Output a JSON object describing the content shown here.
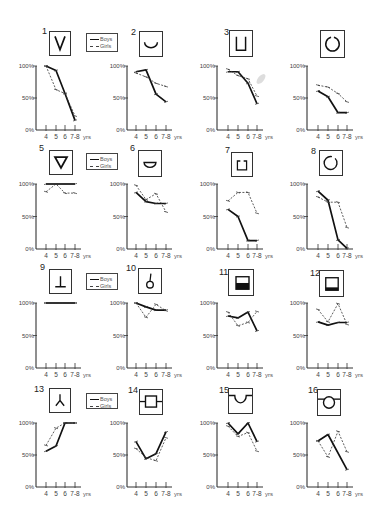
{
  "figure": {
    "legend": {
      "boys_label": "Boys",
      "girls_label": "Girls"
    },
    "y_ticks": [
      "100%",
      "50%",
      "0%"
    ],
    "x_unit": "yrs",
    "colors": {
      "boys": "#111111",
      "girls": "#333333",
      "axis": "#333333"
    }
  },
  "chart_data": [
    {
      "number": "1",
      "shape": "v-shape",
      "type": "line",
      "categories": [
        "4",
        "5",
        "6",
        "7-8"
      ],
      "xlabel": "yrs",
      "ylabel": "",
      "ylim": [
        0,
        100
      ],
      "yticks": [
        "0%",
        "50%",
        "100%"
      ],
      "grid": false,
      "series": [
        {
          "name": "Boys",
          "values": [
            100,
            93,
            57,
            15
          ]
        },
        {
          "name": "Girls",
          "values": [
            100,
            63,
            57,
            22
          ]
        }
      ]
    },
    {
      "number": "2",
      "shape": "arc-shape",
      "type": "line",
      "categories": [
        "4",
        "5",
        "6",
        "7-8"
      ],
      "xlabel": "yrs",
      "ylabel": "",
      "ylim": [
        0,
        100
      ],
      "yticks": [
        "0%",
        "50%",
        "100%"
      ],
      "grid": false,
      "series": [
        {
          "name": "Boys",
          "values": [
            91,
            94,
            56,
            44
          ]
        },
        {
          "name": "Girls",
          "values": [
            89,
            83,
            73,
            68
          ]
        }
      ]
    },
    {
      "number": "3",
      "shape": "u-square-shape",
      "type": "line",
      "categories": [
        "4",
        "5",
        "6",
        "7-8"
      ],
      "xlabel": "yrs",
      "ylabel": "",
      "ylim": [
        0,
        100
      ],
      "yticks": [
        "0%",
        "50%",
        "100%"
      ],
      "grid": false,
      "series": [
        {
          "name": "Boys",
          "values": [
            91,
            91,
            73,
            41
          ]
        },
        {
          "name": "Girls",
          "values": [
            95,
            85,
            80,
            53
          ]
        }
      ]
    },
    {
      "number": "",
      "shape": "open-circle-top-shape",
      "type": "line",
      "categories": [
        "4",
        "5",
        "6",
        "7-8"
      ],
      "xlabel": "yrs",
      "ylabel": "",
      "ylim": [
        0,
        100
      ],
      "yticks": [
        "0%",
        "50%",
        "100%"
      ],
      "grid": false,
      "series": [
        {
          "name": "Boys",
          "values": [
            61,
            52,
            27,
            27
          ]
        },
        {
          "name": "Girls",
          "values": [
            70,
            67,
            57,
            44
          ]
        }
      ]
    },
    {
      "number": "5",
      "shape": "inverted-triangle-shape",
      "type": "line",
      "categories": [
        "4",
        "5",
        "6",
        "7-8"
      ],
      "xlabel": "yrs",
      "ylabel": "",
      "ylim": [
        0,
        100
      ],
      "yticks": [
        "0%",
        "50%",
        "100%"
      ],
      "grid": false,
      "series": [
        {
          "name": "Boys",
          "values": [
            100,
            100,
            100,
            100
          ]
        },
        {
          "name": "Girls",
          "values": [
            88,
            100,
            86,
            86
          ]
        }
      ]
    },
    {
      "number": "6",
      "shape": "half-disk-shape",
      "type": "line",
      "categories": [
        "4",
        "5",
        "6",
        "7-8"
      ],
      "xlabel": "yrs",
      "ylabel": "",
      "ylim": [
        0,
        100
      ],
      "yticks": [
        "0%",
        "50%",
        "100%"
      ],
      "grid": false,
      "series": [
        {
          "name": "Boys",
          "values": [
            87,
            73,
            70,
            70
          ]
        },
        {
          "name": "Girls",
          "values": [
            98,
            76,
            85,
            57
          ]
        }
      ]
    },
    {
      "number": "7",
      "shape": "open-square-top-shape",
      "type": "line",
      "categories": [
        "4",
        "5",
        "6",
        "7-8"
      ],
      "xlabel": "yrs",
      "ylabel": "",
      "ylim": [
        0,
        100
      ],
      "yticks": [
        "0%",
        "50%",
        "100%"
      ],
      "grid": false,
      "series": [
        {
          "name": "Boys",
          "values": [
            61,
            50,
            13,
            13
          ]
        },
        {
          "name": "Girls",
          "values": [
            74,
            87,
            87,
            55
          ]
        }
      ]
    },
    {
      "number": "8",
      "shape": "open-circle-side-shape",
      "type": "line",
      "categories": [
        "4",
        "5",
        "6",
        "7-8"
      ],
      "xlabel": "yrs",
      "ylabel": "",
      "ylim": [
        0,
        100
      ],
      "yticks": [
        "0%",
        "50%",
        "100%"
      ],
      "grid": false,
      "series": [
        {
          "name": "Boys",
          "values": [
            89,
            75,
            14,
            1
          ]
        },
        {
          "name": "Girls",
          "values": [
            80,
            72,
            72,
            33
          ]
        }
      ]
    },
    {
      "number": "9",
      "shape": "inverted-t-shape",
      "type": "line",
      "categories": [
        "4",
        "5",
        "6",
        "7-8"
      ],
      "xlabel": "yrs",
      "ylabel": "",
      "ylim": [
        0,
        100
      ],
      "yticks": [
        "0%",
        "50%",
        "100%"
      ],
      "grid": false,
      "series": [
        {
          "name": "Boys",
          "values": [
            100,
            100,
            100,
            100
          ]
        },
        {
          "name": "Girls",
          "values": [
            100,
            100,
            100,
            100
          ]
        }
      ]
    },
    {
      "number": "10",
      "shape": "lollipop-shape",
      "type": "line",
      "categories": [
        "4",
        "5",
        "6",
        "7-8"
      ],
      "xlabel": "yrs",
      "ylabel": "",
      "ylim": [
        0,
        100
      ],
      "yticks": [
        "0%",
        "50%",
        "100%"
      ],
      "grid": false,
      "series": [
        {
          "name": "Boys",
          "values": [
            100,
            94,
            89,
            89
          ]
        },
        {
          "name": "Girls",
          "values": [
            100,
            78,
            98,
            88
          ]
        }
      ]
    },
    {
      "number": "11",
      "shape": "half-filled-square-shape",
      "type": "line",
      "categories": [
        "4",
        "5",
        "6",
        "7-8"
      ],
      "xlabel": "yrs",
      "ylabel": "",
      "ylim": [
        0,
        100
      ],
      "yticks": [
        "0%",
        "50%",
        "100%"
      ],
      "grid": false,
      "series": [
        {
          "name": "Boys",
          "values": [
            80,
            77,
            86,
            57
          ]
        },
        {
          "name": "Girls",
          "values": [
            86,
            65,
            70,
            87
          ]
        }
      ]
    },
    {
      "number": "12",
      "shape": "strip-filled-square-shape",
      "type": "line",
      "categories": [
        "4",
        "5",
        "6",
        "7-8"
      ],
      "xlabel": "yrs",
      "ylabel": "",
      "ylim": [
        0,
        100
      ],
      "yticks": [
        "0%",
        "50%",
        "100%"
      ],
      "grid": false,
      "series": [
        {
          "name": "Boys",
          "values": [
            71,
            66,
            70,
            70
          ]
        },
        {
          "name": "Girls",
          "values": [
            90,
            71,
            99,
            67
          ]
        }
      ]
    },
    {
      "number": "13",
      "shape": "inverted-y-shape",
      "type": "line",
      "categories": [
        "4",
        "5",
        "6",
        "7-8"
      ],
      "xlabel": "yrs",
      "ylabel": "",
      "ylim": [
        0,
        100
      ],
      "yticks": [
        "0%",
        "50%",
        "100%"
      ],
      "grid": false,
      "series": [
        {
          "name": "Boys",
          "values": [
            56,
            64,
            100,
            100
          ]
        },
        {
          "name": "Girls",
          "values": [
            65,
            92,
            100,
            100
          ]
        }
      ]
    },
    {
      "number": "14",
      "shape": "square-on-line-shape",
      "type": "line",
      "categories": [
        "4",
        "5",
        "6",
        "7-8"
      ],
      "xlabel": "yrs",
      "ylabel": "",
      "ylim": [
        0,
        100
      ],
      "yticks": [
        "0%",
        "50%",
        "100%"
      ],
      "grid": false,
      "series": [
        {
          "name": "Boys",
          "values": [
            71,
            44,
            52,
            86
          ]
        },
        {
          "name": "Girls",
          "values": [
            60,
            46,
            41,
            77
          ]
        }
      ]
    },
    {
      "number": "15",
      "shape": "notch-on-line-shape",
      "type": "line",
      "categories": [
        "4",
        "5",
        "6",
        "7-8"
      ],
      "xlabel": "yrs",
      "ylabel": "",
      "ylim": [
        0,
        100
      ],
      "yticks": [
        "0%",
        "50%",
        "100%"
      ],
      "grid": false,
      "series": [
        {
          "name": "Boys",
          "values": [
            100,
            83,
            100,
            71
          ]
        },
        {
          "name": "Girls",
          "values": [
            95,
            79,
            85,
            56
          ]
        }
      ]
    },
    {
      "number": "16",
      "shape": "circle-on-line-shape",
      "type": "line",
      "categories": [
        "4",
        "5",
        "6",
        "7-8"
      ],
      "xlabel": "yrs",
      "ylabel": "",
      "ylim": [
        0,
        100
      ],
      "yticks": [
        "0%",
        "50%",
        "100%"
      ],
      "grid": false,
      "series": [
        {
          "name": "Boys",
          "values": [
            72,
            82,
            null,
            27
          ]
        },
        {
          "name": "Girls",
          "values": [
            72,
            47,
            87,
            55
          ]
        }
      ]
    }
  ]
}
